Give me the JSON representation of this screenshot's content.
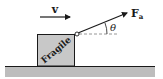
{
  "diagram": {
    "velocity": {
      "label": "v"
    },
    "force": {
      "label": "F",
      "subscript": "a"
    },
    "angle": {
      "label": "θ"
    },
    "box": {
      "label": "Fragile"
    },
    "colors": {
      "box_fill": "#c8c8c8",
      "ground_fill": "#bdbdbd",
      "ink": "#1a1a1a",
      "dashed": "#8a8a8a"
    }
  }
}
